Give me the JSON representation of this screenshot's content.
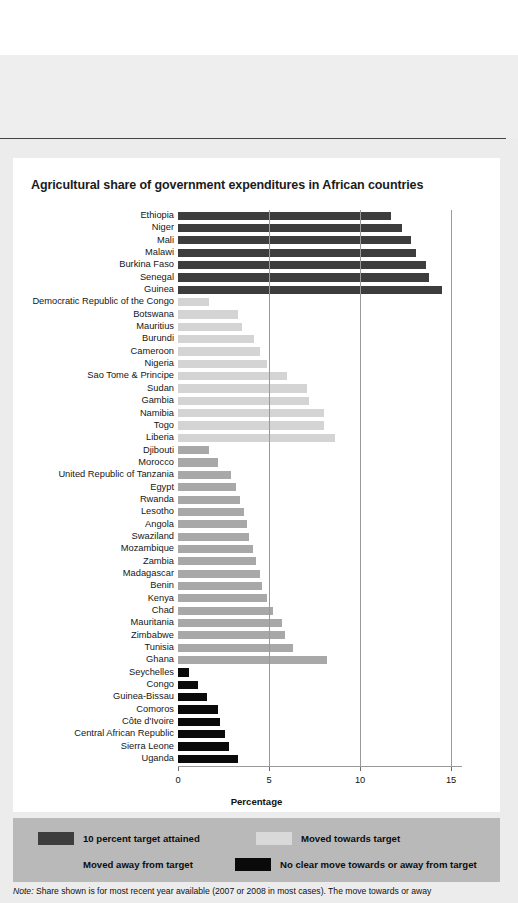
{
  "chart_data": {
    "type": "bar",
    "orientation": "horizontal",
    "title": "Agricultural share of government expenditures in African countries",
    "xlabel": "Percentage",
    "ylabel": "",
    "xlim": [
      0,
      15.6
    ],
    "xticks": [
      0,
      5,
      10,
      15
    ],
    "xtick_labels": [
      "0",
      "5",
      "10",
      "15"
    ],
    "grid": "vertical",
    "legend_position": "below",
    "categories": [
      "Ethiopia",
      "Niger",
      "Mali",
      "Malawi",
      "Burkina Faso",
      "Senegal",
      "Guinea",
      "Democratic Republic of the Congo",
      "Botswana",
      "Mauritius",
      "Burundi",
      "Cameroon",
      "Nigeria",
      "Sao Tome & Principe",
      "Sudan",
      "Gambia",
      "Namibia",
      "Togo",
      "Liberia",
      "Djibouti",
      "Morocco",
      "United Republic of Tanzania",
      "Egypt",
      "Rwanda",
      "Lesotho",
      "Angola",
      "Swaziland",
      "Mozambique",
      "Zambia",
      "Madagascar",
      "Benin",
      "Kenya",
      "Chad",
      "Mauritania",
      "Zimbabwe",
      "Tunisia",
      "Ghana",
      "Seychelles",
      "Congo",
      "Guinea-Bissau",
      "Comoros",
      "Côte d'Ivoire",
      "Central African Republic",
      "Sierra Leone",
      "Uganda"
    ],
    "values": [
      11.7,
      12.3,
      12.8,
      13.1,
      13.6,
      13.8,
      14.5,
      1.7,
      3.3,
      3.5,
      4.2,
      4.5,
      4.9,
      6.0,
      7.1,
      7.2,
      8.0,
      8.0,
      8.6,
      1.7,
      2.2,
      2.9,
      3.2,
      3.4,
      3.6,
      3.8,
      3.9,
      4.1,
      4.3,
      4.5,
      4.6,
      4.9,
      5.2,
      5.7,
      5.9,
      6.3,
      8.2,
      0.6,
      1.1,
      1.6,
      2.2,
      2.3,
      2.6,
      2.8,
      3.3
    ],
    "groups": [
      "target",
      "target",
      "target",
      "target",
      "target",
      "target",
      "target",
      "towards",
      "towards",
      "towards",
      "towards",
      "towards",
      "towards",
      "towards",
      "towards",
      "towards",
      "towards",
      "towards",
      "towards",
      "away",
      "away",
      "away",
      "away",
      "away",
      "away",
      "away",
      "away",
      "away",
      "away",
      "away",
      "away",
      "away",
      "away",
      "away",
      "away",
      "away",
      "away",
      "noclear",
      "noclear",
      "noclear",
      "noclear",
      "noclear",
      "noclear",
      "noclear",
      "noclear"
    ],
    "colors": {
      "target": "#3d3d3d",
      "towards": "#d4d4d4",
      "away": "#a8a8a8",
      "noclear": "#0a0a0a",
      "gridline": "#9a9a9a",
      "panel": "#ffffff",
      "page": "#ececec",
      "legend_bg": "#b9b9b9"
    }
  },
  "legend": {
    "items": [
      {
        "label": "10 percent target attained",
        "color": "#3d3d3d"
      },
      {
        "label": "Moved towards target",
        "color": "#d9d9d9"
      },
      {
        "label": "Moved away from target",
        "color": "#b9b9b9"
      },
      {
        "label": "No clear move towards or away from target",
        "color": "#0a0a0a"
      }
    ]
  },
  "note": {
    "prefix": "Note:",
    "text": " Share shown is for most recent year available (2007 or 2008 in most cases). The move towards or away"
  }
}
